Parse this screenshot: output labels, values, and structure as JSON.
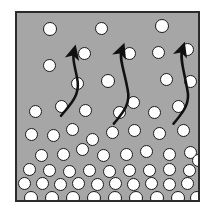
{
  "figure": {
    "frame": {
      "x": 15,
      "y": 11,
      "width": 185,
      "height": 191,
      "fill_color": "#a6a6a6",
      "border_color": "#2b2b2b",
      "border_width": 2
    },
    "background_color": "#ffffff",
    "particle_style": {
      "fill_color": "#ffffff",
      "outline_color": "#1a1a1a",
      "outline_width": 1.4,
      "diameter": 13
    },
    "arrow_style": {
      "color": "#111111",
      "stroke_width": 2.6,
      "head_length": 9,
      "head_width": 8
    },
    "particles": [
      {
        "cx": 48,
        "cy": 27,
        "d": 14
      },
      {
        "cx": 99,
        "cy": 26,
        "d": 13
      },
      {
        "cx": 160,
        "cy": 24,
        "d": 14
      },
      {
        "cx": 82,
        "cy": 51,
        "d": 13
      },
      {
        "cx": 127,
        "cy": 51,
        "d": 13
      },
      {
        "cx": 156,
        "cy": 50,
        "d": 13
      },
      {
        "cx": 185,
        "cy": 47,
        "d": 13
      },
      {
        "cx": 47,
        "cy": 63,
        "d": 13
      },
      {
        "cx": 106,
        "cy": 79,
        "d": 14
      },
      {
        "cx": 75,
        "cy": 81,
        "d": 13
      },
      {
        "cx": 164,
        "cy": 77,
        "d": 13
      },
      {
        "cx": 188,
        "cy": 79,
        "d": 13
      },
      {
        "cx": 33,
        "cy": 109,
        "d": 13
      },
      {
        "cx": 59,
        "cy": 104,
        "d": 13
      },
      {
        "cx": 83,
        "cy": 108,
        "d": 13
      },
      {
        "cx": 117,
        "cy": 110,
        "d": 13
      },
      {
        "cx": 131,
        "cy": 100,
        "d": 13
      },
      {
        "cx": 152,
        "cy": 110,
        "d": 13
      },
      {
        "cx": 176,
        "cy": 104,
        "d": 13
      },
      {
        "cx": 70,
        "cy": 127,
        "d": 13
      },
      {
        "cx": 110,
        "cy": 130,
        "d": 13
      },
      {
        "cx": 132,
        "cy": 128,
        "d": 13
      },
      {
        "cx": 29,
        "cy": 132,
        "d": 13
      },
      {
        "cx": 51,
        "cy": 133,
        "d": 13
      },
      {
        "cx": 90,
        "cy": 137,
        "d": 13
      },
      {
        "cx": 157,
        "cy": 131,
        "d": 13
      },
      {
        "cx": 181,
        "cy": 128,
        "d": 13
      },
      {
        "cx": 39,
        "cy": 153,
        "d": 13
      },
      {
        "cx": 61,
        "cy": 152,
        "d": 13
      },
      {
        "cx": 80,
        "cy": 147,
        "d": 13
      },
      {
        "cx": 101,
        "cy": 153,
        "d": 13
      },
      {
        "cx": 124,
        "cy": 152,
        "d": 13
      },
      {
        "cx": 144,
        "cy": 149,
        "d": 13
      },
      {
        "cx": 167,
        "cy": 152,
        "d": 13
      },
      {
        "cx": 188,
        "cy": 150,
        "d": 13
      },
      {
        "cx": 196,
        "cy": 158,
        "d": 13
      },
      {
        "cx": 27,
        "cy": 167,
        "d": 13
      },
      {
        "cx": 47,
        "cy": 168,
        "d": 13
      },
      {
        "cx": 67,
        "cy": 169,
        "d": 13
      },
      {
        "cx": 87,
        "cy": 168,
        "d": 13
      },
      {
        "cx": 107,
        "cy": 169,
        "d": 13
      },
      {
        "cx": 127,
        "cy": 168,
        "d": 13
      },
      {
        "cx": 147,
        "cy": 168,
        "d": 13
      },
      {
        "cx": 167,
        "cy": 167,
        "d": 13
      },
      {
        "cx": 187,
        "cy": 168,
        "d": 13
      },
      {
        "cx": 22,
        "cy": 181,
        "d": 13
      },
      {
        "cx": 40,
        "cy": 181,
        "d": 13
      },
      {
        "cx": 58,
        "cy": 182,
        "d": 13
      },
      {
        "cx": 76,
        "cy": 181,
        "d": 13
      },
      {
        "cx": 95,
        "cy": 182,
        "d": 13
      },
      {
        "cx": 113,
        "cy": 181,
        "d": 13
      },
      {
        "cx": 131,
        "cy": 182,
        "d": 13
      },
      {
        "cx": 149,
        "cy": 181,
        "d": 13
      },
      {
        "cx": 167,
        "cy": 182,
        "d": 13
      },
      {
        "cx": 185,
        "cy": 181,
        "d": 13
      },
      {
        "cx": 29,
        "cy": 196,
        "d": 14
      },
      {
        "cx": 50,
        "cy": 196,
        "d": 14
      },
      {
        "cx": 71,
        "cy": 196,
        "d": 14
      },
      {
        "cx": 92,
        "cy": 196,
        "d": 14
      },
      {
        "cx": 113,
        "cy": 196,
        "d": 14
      },
      {
        "cx": 134,
        "cy": 196,
        "d": 14
      },
      {
        "cx": 155,
        "cy": 196,
        "d": 14
      },
      {
        "cx": 176,
        "cy": 196,
        "d": 14
      },
      {
        "cx": 195,
        "cy": 196,
        "d": 14
      }
    ],
    "arrows": [
      {
        "name": "left-flow-arrow",
        "path": "M 45 105 C 52 96, 64 86, 62 70 C 60 56, 56 48, 58 40"
      },
      {
        "name": "center-flow-arrow",
        "path": "M 99 113 C 106 104, 117 94, 113 78 C 110 60, 104 46, 107 38"
      },
      {
        "name": "right-flow-arrow",
        "path": "M 160 113 C 167 104, 178 94, 174 78 C 171 60, 166 46, 169 37"
      }
    ]
  }
}
